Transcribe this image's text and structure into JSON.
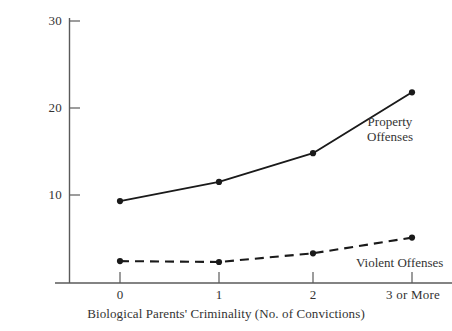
{
  "chart_data": {
    "type": "line",
    "title": "",
    "xlabel": "Biological Parents' Criminality (No. of Convictions)",
    "ylabel": "% of Sons",
    "categories": [
      "0",
      "1",
      "2",
      "3 or More"
    ],
    "yticks": [
      10,
      20,
      30
    ],
    "ytick_labels": [
      "10",
      "20",
      "30"
    ],
    "ylim": [
      0,
      31.5
    ],
    "grid": false,
    "legend_position": "inline-annotation",
    "series": [
      {
        "name": "Property Offenses",
        "style": "solid",
        "marker": "filled-circle",
        "color": "#1a1a1a",
        "values": [
          9.3,
          11.5,
          14.8,
          21.8
        ]
      },
      {
        "name": "Violent Offenses",
        "style": "dashed",
        "marker": "filled-circle",
        "color": "#1a1a1a",
        "values": [
          2.4,
          2.3,
          3.3,
          5.1
        ]
      }
    ],
    "annotations": [
      {
        "text": "Property",
        "series": "Property Offenses"
      },
      {
        "text": "Offenses",
        "series": "Property Offenses"
      },
      {
        "text": "Violent Offenses",
        "series": "Violent Offenses"
      }
    ]
  },
  "axis": {
    "y_title": "% of Sons",
    "x_title": "Biological Parents' Criminality (No. of Convictions)",
    "y_tick_0": "30",
    "y_tick_1": "20",
    "y_tick_2": "10",
    "x_tick_0": "0",
    "x_tick_1": "1",
    "x_tick_2": "2",
    "x_tick_3": "3 or More"
  },
  "labels": {
    "property_line_1": "Property",
    "property_line_2": "Offenses",
    "violent": "Violent Offenses"
  },
  "colors": {
    "line": "#1a1a1a",
    "axis": "#5a5a5a",
    "text": "#333333",
    "background": "#ffffff"
  }
}
